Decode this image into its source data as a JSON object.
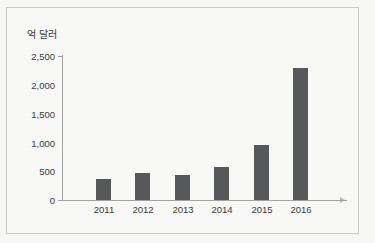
{
  "chart_data": {
    "type": "bar",
    "title": "",
    "subtitle": "",
    "unit_label": "억 달러",
    "xlabel": "",
    "ylabel": "억 달러",
    "categories": [
      "2011",
      "2012",
      "2013",
      "2014",
      "2015",
      "2016"
    ],
    "values": [
      360,
      470,
      440,
      580,
      960,
      2300
    ],
    "series": [
      {
        "name": "",
        "values": [
          360,
          470,
          440,
          580,
          960,
          2300
        ]
      }
    ],
    "ylim": [
      0,
      2500
    ],
    "y_ticks": [
      0,
      500,
      1000,
      1500,
      2000,
      2500
    ],
    "y_tick_labels": [
      "0",
      "500",
      "1,000",
      "1,500",
      "2,000",
      "2,500"
    ],
    "x_tick_labels": [
      "2011",
      "2012",
      "2013",
      "2014",
      "2015",
      "2016"
    ],
    "grid": false,
    "legend": null,
    "legend_position": "none",
    "annotations": [],
    "colors": {
      "bar": "#57585a",
      "axis": "#a2a2a2",
      "text": "#3c3c3c",
      "background": "#f8f8f7",
      "border": "#c9c9c9"
    }
  }
}
